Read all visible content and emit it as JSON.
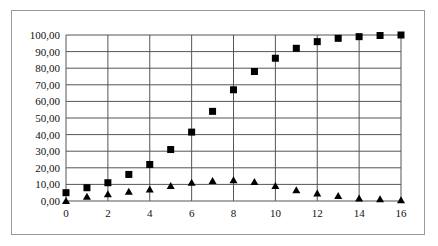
{
  "chart_data": {
    "type": "scatter",
    "title": "",
    "xlabel": "",
    "ylabel": "",
    "xlim": [
      0,
      16
    ],
    "ylim": [
      0,
      100
    ],
    "x_ticks": [
      "0",
      "2",
      "4",
      "6",
      "8",
      "10",
      "12",
      "14",
      "16"
    ],
    "y_ticks": [
      "0,00",
      "10,00",
      "20,00",
      "30,00",
      "40,00",
      "50,00",
      "60,00",
      "70,00",
      "80,00",
      "90,00",
      "100,00"
    ],
    "grid": true,
    "legend": null,
    "x": [
      0,
      1,
      2,
      3,
      4,
      5,
      6,
      7,
      8,
      9,
      10,
      11,
      12,
      13,
      14,
      15,
      16
    ],
    "series": [
      {
        "name": "squares",
        "marker": "square",
        "values": [
          5,
          8,
          11,
          16,
          22,
          31,
          41.5,
          54,
          67,
          78,
          86,
          92,
          96,
          98,
          99,
          99.7,
          100
        ]
      },
      {
        "name": "triangles",
        "marker": "triangle",
        "values": [
          0,
          2.5,
          4,
          5.5,
          7,
          9,
          11,
          12,
          12.5,
          11.5,
          9,
          6.5,
          4.5,
          3,
          1.5,
          1,
          0.5
        ]
      }
    ]
  }
}
